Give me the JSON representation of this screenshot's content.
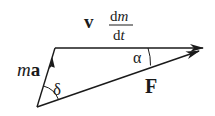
{
  "diagram": {
    "labels": {
      "ma_italic": "m",
      "ma_bold": "a",
      "v_bold": "v",
      "frac_num": "dm",
      "frac_num_d": "d",
      "frac_num_m": "m",
      "frac_den_d": "d",
      "frac_den_t": "t",
      "force": "F",
      "alpha": "α",
      "delta": "δ"
    },
    "vectors": [
      {
        "name": "ma",
        "description": "m a vector, from base vertex up to top-left vertex"
      },
      {
        "name": "v_dm_dt",
        "description": "v dm/dt vector, horizontal to the right"
      },
      {
        "name": "F",
        "description": "resultant force F, from base vertex to right tip"
      }
    ],
    "angles": [
      {
        "name": "alpha",
        "between": [
          "v_dm_dt",
          "F"
        ]
      },
      {
        "name": "delta",
        "between": [
          "ma",
          "F"
        ]
      }
    ],
    "colors": {
      "ink": "#1a1a1a",
      "background": "#ffffff"
    }
  }
}
